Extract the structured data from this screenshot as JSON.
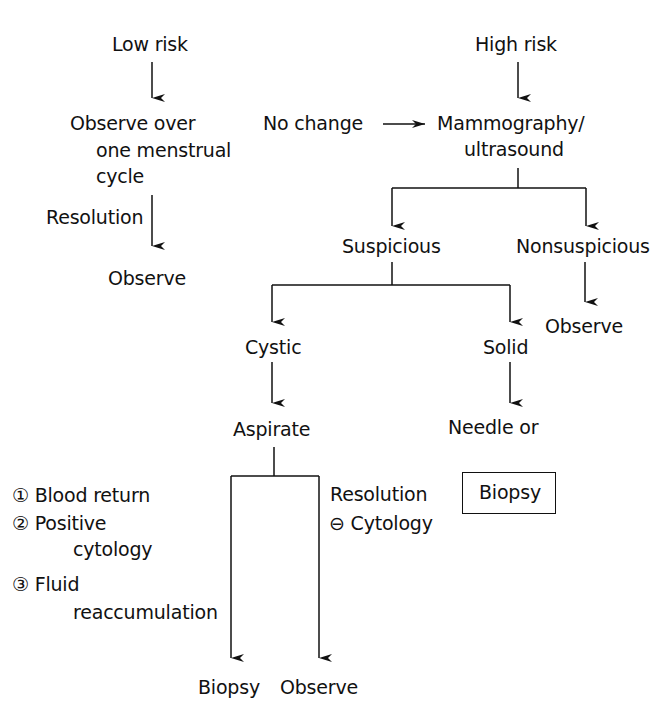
{
  "diagram": {
    "low_risk": {
      "title": "Low risk",
      "observe_line1": "Observe over",
      "observe_line2": "one menstrual",
      "observe_line3": "cycle",
      "resolution": "Resolution",
      "observe": "Observe"
    },
    "high_risk": {
      "title": "High risk",
      "no_change": "No change",
      "imaging_line1": "Mammography/",
      "imaging_line2": "ultrasound",
      "suspicious": "Suspicious",
      "nonsuspicious": "Nonsuspicious",
      "nonsuspicious_observe": "Observe"
    },
    "suspicious_branch": {
      "cystic": "Cystic",
      "aspirate": "Aspirate",
      "solid": "Solid",
      "needle_line1": "Needle or",
      "needle_line2": "excisional",
      "biopsy_box": "Biopsy"
    },
    "aspirate_outcomes": {
      "criteria": [
        {
          "marker": "①",
          "line1": "Blood return",
          "line2": ""
        },
        {
          "marker": "②",
          "line1": "Positive",
          "line2": "cytology"
        },
        {
          "marker": "③",
          "line1": "Fluid",
          "line2": "reaccumulation"
        }
      ],
      "resolution": "Resolution",
      "negative_marker": "⊖",
      "negative_cytology": "Cytology",
      "biopsy": "Biopsy",
      "observe": "Observe"
    }
  }
}
